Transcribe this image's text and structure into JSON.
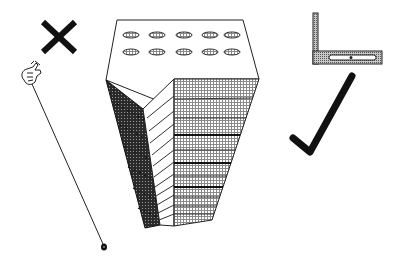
{
  "illustration": {
    "description": "Worm's-eye view of a skyscraper between a wrong indicator (X with plumb line) and a right indicator (carpenter's square with check mark)",
    "left_group": {
      "mark": "x-mark",
      "tool": "plumb-bob",
      "hand": "hand-holding-string"
    },
    "center_group": {
      "object": "skyscraper",
      "view": "looking up from below",
      "roof_windows_rows": 2,
      "roof_windows_per_row": 5
    },
    "right_group": {
      "tool": "carpenter-square",
      "mark": "check-mark"
    },
    "colors": {
      "ink": "#111111",
      "background": "#ffffff",
      "dark_face": "#3a3a3a",
      "light_face": "#c8c8c8",
      "square_fill": "#9a9a9a"
    }
  }
}
